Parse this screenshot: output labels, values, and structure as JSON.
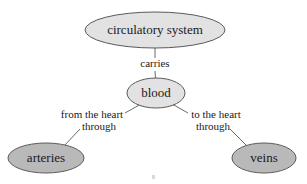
{
  "diagram": {
    "background_color": "#ffffff",
    "node_fill_light": "#e2e2e2",
    "node_fill_dark": "#b9b9b9",
    "node_stroke": "#5a5a5a",
    "edge_color": "#6b6b6b",
    "text_color": "#1a1a1a",
    "nodes": [
      {
        "id": "circulatory-system",
        "label": "circulatory system",
        "shape": "ellipse",
        "fill": "#e2e2e2",
        "cx": 155,
        "cy": 30,
        "rx": 70,
        "ry": 18,
        "font_size": 13
      },
      {
        "id": "blood",
        "label": "blood",
        "shape": "ellipse",
        "fill": "#e2e2e2",
        "cx": 156,
        "cy": 93,
        "rx": 29,
        "ry": 15,
        "font_size": 13
      },
      {
        "id": "arteries",
        "label": "arteries",
        "shape": "ellipse",
        "fill": "#b9b9b9",
        "cx": 46,
        "cy": 158,
        "rx": 38,
        "ry": 15,
        "font_size": 13
      },
      {
        "id": "veins",
        "label": "veins",
        "shape": "ellipse",
        "fill": "#b9b9b9",
        "cx": 264,
        "cy": 158,
        "rx": 32,
        "ry": 15,
        "font_size": 13
      }
    ],
    "edges": [
      {
        "id": "edge-circulatory-blood",
        "from": "circulatory-system",
        "to": "blood",
        "label": "carries",
        "label_lines": [
          "carries"
        ],
        "label_x": 155,
        "label_y": 67,
        "font_size": 11
      },
      {
        "id": "edge-blood-arteries",
        "from": "blood",
        "to": "arteries",
        "label": "from the heart through",
        "label_lines": [
          "from the heart",
          "through"
        ],
        "label_x": 92,
        "label_y": 120,
        "font_size": 11
      },
      {
        "id": "edge-blood-veins",
        "from": "blood",
        "to": "veins",
        "label": "to the heart through",
        "label_lines": [
          "to the heart",
          "through"
        ],
        "label_x": 216,
        "label_y": 120,
        "font_size": 11
      }
    ]
  }
}
